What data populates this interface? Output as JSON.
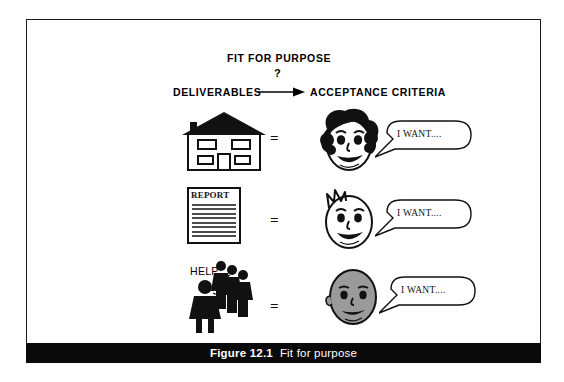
{
  "figure": {
    "caption_number": "Figure 12.1",
    "caption_text": "Fit for purpose",
    "title": "FIT FOR PURPOSE",
    "question_mark": "?",
    "left_column_label": "DELIVERABLES",
    "right_column_label": "ACCEPTANCE CRITERIA",
    "arrow_icon": "right-arrow-icon"
  },
  "rows": [
    {
      "deliverable_icon": "house-icon",
      "deliverable_label": "",
      "relation": "=",
      "person_icon": "curly-haired-face-icon",
      "bubble_text": "I WANT...."
    },
    {
      "deliverable_icon": "report-document-icon",
      "deliverable_label": "REPORT",
      "relation": "=",
      "person_icon": "spiky-haired-face-icon",
      "bubble_text": "I WANT...."
    },
    {
      "deliverable_icon": "help-people-icon",
      "deliverable_label": "HELP",
      "relation": "=",
      "person_icon": "bald-grey-face-icon",
      "bubble_text": "I WANT...."
    }
  ],
  "colors": {
    "ink": "#000000",
    "caption_bar_bg": "#0a0a0a",
    "caption_bar_text": "#ffffff",
    "page_bg": "#ffffff",
    "grey_face_fill": "#9a9a9a"
  }
}
